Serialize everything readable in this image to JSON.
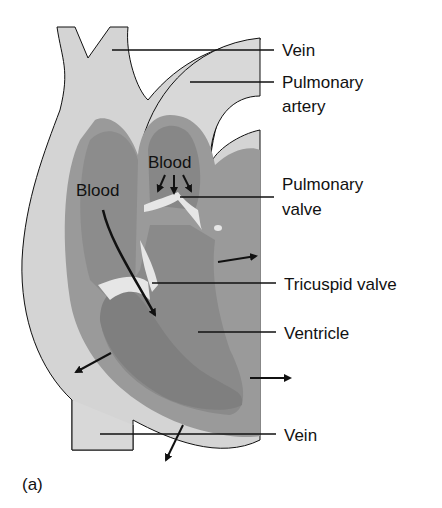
{
  "figure": {
    "caption": "(a)",
    "colors": {
      "outer_tissue": "#d4d4d4",
      "mid_wall": "#9a9a9a",
      "chamber": "#8a8a8a",
      "inner_dark": "#808080",
      "valve_light": "#e6e6e6",
      "line": "#111111"
    },
    "labels": [
      {
        "id": "vein-top",
        "text": "Vein"
      },
      {
        "id": "pulmonary-artery-1",
        "text": "Pulmonary"
      },
      {
        "id": "pulmonary-artery-2",
        "text": "artery"
      },
      {
        "id": "pulmonary-valve-1",
        "text": "Pulmonary"
      },
      {
        "id": "pulmonary-valve-2",
        "text": "valve"
      },
      {
        "id": "tricuspid-valve",
        "text": "Tricuspid valve"
      },
      {
        "id": "ventricle",
        "text": "Ventricle"
      },
      {
        "id": "vein-bottom",
        "text": "Vein"
      }
    ],
    "inner_labels": [
      {
        "id": "blood-left",
        "text": "Blood"
      },
      {
        "id": "blood-top",
        "text": "Blood"
      }
    ]
  }
}
